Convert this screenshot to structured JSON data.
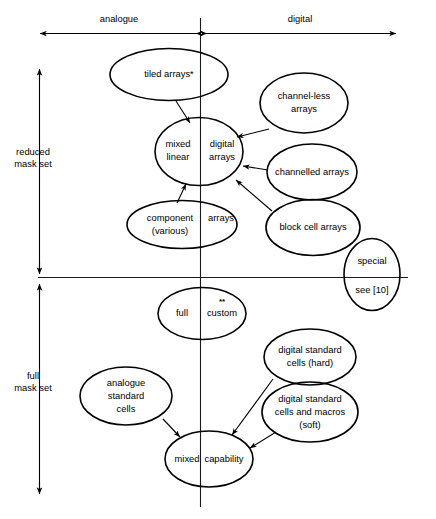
{
  "diagram": {
    "axes": {
      "horizontal": {
        "left_label": "analogue",
        "right_label": "digital",
        "divider_note": "vertical centre line separates analogue (left) from digital (right)"
      },
      "vertical": {
        "top_label_line1": "reduced",
        "top_label_line2": "mask set",
        "bottom_label_line1": "full",
        "bottom_label_line2": "mask set"
      }
    },
    "nodes": [
      {
        "id": "tiled-arrays",
        "lines": [
          "tiled arrays*"
        ]
      },
      {
        "id": "mixed-linear-digital-arrays",
        "lines": [
          "mixed",
          "linear",
          "digital",
          "arrays"
        ],
        "left_lines": [
          "mixed",
          "linear"
        ],
        "right_lines": [
          "digital",
          "arrays"
        ]
      },
      {
        "id": "component-various-arrays",
        "left_lines": [
          "component",
          "(various)"
        ],
        "right_lines": [
          "arrays"
        ]
      },
      {
        "id": "channel-less-arrays",
        "lines": [
          "channel-less",
          "arrays"
        ]
      },
      {
        "id": "channelled-arrays",
        "lines": [
          "channelled arrays"
        ]
      },
      {
        "id": "block-cell-arrays",
        "lines": [
          "block cell arrays"
        ]
      },
      {
        "id": "special-see-10",
        "lines": [
          "special",
          "see [10]"
        ]
      },
      {
        "id": "full-custom",
        "left_lines": [
          "full"
        ],
        "right_lines": [
          "custom"
        ],
        "superscript": "**"
      },
      {
        "id": "digital-standard-cells-hard",
        "lines": [
          "digital standard",
          "cells (hard)"
        ]
      },
      {
        "id": "digital-standard-cells-macros-soft",
        "lines": [
          "digital standard",
          "cells and macros",
          "(soft)"
        ]
      },
      {
        "id": "analogue-standard-cells",
        "lines": [
          "analogue",
          "standard",
          "cells"
        ]
      },
      {
        "id": "mixed-capability",
        "left_lines": [
          "mixed"
        ],
        "right_lines": [
          "capability"
        ]
      }
    ],
    "labels": {
      "analogue": "analogue",
      "digital": "digital",
      "reduced_mask_set_l1": "reduced",
      "reduced_mask_set_l2": "mask set",
      "full_mask_set_l1": "full",
      "full_mask_set_l2": "mask set",
      "tiled_arrays": "tiled arrays*",
      "mixed": "mixed",
      "linear": "linear",
      "digital_word": "digital",
      "arrays": "arrays",
      "component": "component",
      "various": "(various)",
      "arrays_right": "arrays",
      "channel_less": "channel-less",
      "channel_less_arrays": "arrays",
      "channelled_arrays": "channelled arrays",
      "block_cell_arrays": "block cell arrays",
      "special": "special",
      "see_10": "see [10]",
      "full": "full",
      "custom": "custom",
      "custom_superscript": "**",
      "dsc_hard_l1": "digital standard",
      "dsc_hard_l2": "cells (hard)",
      "dsc_soft_l1": "digital standard",
      "dsc_soft_l2": "cells and macros",
      "dsc_soft_l3": "(soft)",
      "asc_l1": "analogue",
      "asc_l2": "standard",
      "asc_l3": "cells",
      "mixed_cap_l1": "mixed",
      "mixed_cap_l2": "capability"
    },
    "colors": {
      "stroke": "#000000",
      "background": "#ffffff",
      "axis": "#1a1a1a"
    }
  }
}
